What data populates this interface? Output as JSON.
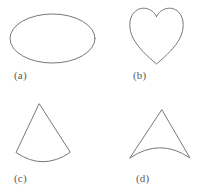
{
  "figure": {
    "background_color": "#ffffff",
    "stroke_color": "#787878",
    "label_color": "#5a5a5a",
    "width": 208,
    "height": 195,
    "panels": [
      {
        "key": "a",
        "label": "(a)",
        "shape_name": "ellipse",
        "description": "A wide horizontal ellipse outline",
        "bounds": {
          "x": 10,
          "y": 14,
          "width": 85,
          "height": 49
        }
      },
      {
        "key": "b",
        "label": "(b)",
        "shape_name": "heart",
        "description": "A heart outline with two rounded top lobes, a notch at the top center and a point at the bottom",
        "bounds": {
          "x": 130,
          "y": 8,
          "width": 53,
          "height": 56
        }
      },
      {
        "key": "c",
        "label": "(c)",
        "shape_name": "circular-sector-cone",
        "description": "A cone or circular sector with an apex at the top and a base arc bulging downward",
        "bounds": {
          "x": 16,
          "y": 104,
          "width": 54,
          "height": 61
        }
      },
      {
        "key": "d",
        "label": "(d)",
        "shape_name": "concave-triangle",
        "description": "A triangular shape with two straight upper sides meeting at a top apex and a base arc bulging upward making the region concave",
        "bounds": {
          "x": 130,
          "y": 110,
          "width": 60,
          "height": 48
        }
      }
    ]
  }
}
